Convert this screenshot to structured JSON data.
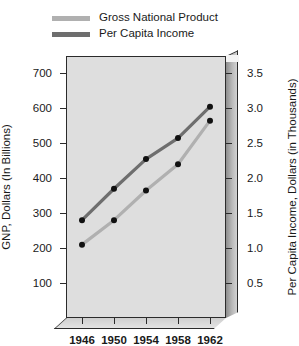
{
  "chart_data": {
    "type": "line",
    "title": "",
    "xlabel": "",
    "ylabel": "GNP, Dollars (In Billions)",
    "y2label": "Per Capita Income, Dollars (in Thousands)",
    "x": [
      "1946",
      "1950",
      "1954",
      "1958",
      "1962"
    ],
    "grid": false,
    "legend_position": "top-left",
    "ylim": [
      0,
      750
    ],
    "yticks": [
      "100",
      "200",
      "300",
      "400",
      "500",
      "600",
      "700"
    ],
    "ytick_values": [
      100,
      200,
      300,
      400,
      500,
      600,
      700
    ],
    "y2lim": [
      0,
      3.75
    ],
    "y2ticks": [
      "0.5",
      "1.0",
      "1.5",
      "2.0",
      "2.5",
      "3.0",
      "3.5"
    ],
    "y2tick_values": [
      0.5,
      1.0,
      1.5,
      2.0,
      2.5,
      3.0,
      3.5
    ],
    "series": [
      {
        "name": "Gross National Product",
        "axis": "left",
        "color": "#b0b0b0",
        "marker_color": "#111111",
        "values": [
          210,
          280,
          365,
          440,
          565
        ]
      },
      {
        "name": "Per Capita Income",
        "axis": "left",
        "color": "#6e6e6e",
        "marker_color": "#111111",
        "values": [
          280,
          370,
          455,
          515,
          605
        ]
      }
    ]
  },
  "legend": {
    "items": [
      {
        "label": "Gross National Product",
        "color": "#b0b0b0"
      },
      {
        "label": "Per Capita Income",
        "color": "#6e6e6e"
      }
    ]
  },
  "axes": {
    "left_title": "GNP, Dollars (In Billions)",
    "right_title": "Per Capita Income, Dollars (in Thousands)"
  },
  "colors": {
    "plot_background": "#dedede",
    "frame": "#2b2b2b",
    "page_background": "#ffffff",
    "text": "#1a1a1a"
  }
}
